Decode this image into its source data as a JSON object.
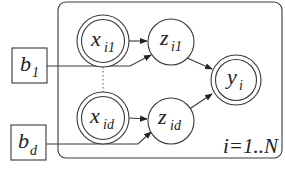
{
  "diagram": {
    "type": "plate-notation graphical model",
    "plate": {
      "label": "i=1..N"
    },
    "nodes": {
      "x_i1": {
        "main": "x",
        "sub": "i1",
        "kind": "observed"
      },
      "x_id": {
        "main": "x",
        "sub": "id",
        "kind": "observed"
      },
      "z_i1": {
        "main": "z",
        "sub": "i1",
        "kind": "latent"
      },
      "z_id": {
        "main": "z",
        "sub": "id",
        "kind": "latent"
      },
      "y_i": {
        "main": "y",
        "sub": "i",
        "kind": "observed"
      },
      "b_1": {
        "main": "b",
        "sub": "1",
        "kind": "parameter"
      },
      "b_d": {
        "main": "b",
        "sub": "d",
        "kind": "parameter"
      }
    },
    "edges": [
      {
        "from": "x_i1",
        "to": "z_i1"
      },
      {
        "from": "b_1",
        "to": "z_i1"
      },
      {
        "from": "x_id",
        "to": "z_id"
      },
      {
        "from": "b_d",
        "to": "z_id"
      },
      {
        "from": "z_i1",
        "to": "y_i"
      },
      {
        "from": "z_id",
        "to": "y_i"
      }
    ],
    "colors": {
      "stroke": "#3a3a3a",
      "text": "#222222",
      "background": "#ffffff"
    }
  }
}
